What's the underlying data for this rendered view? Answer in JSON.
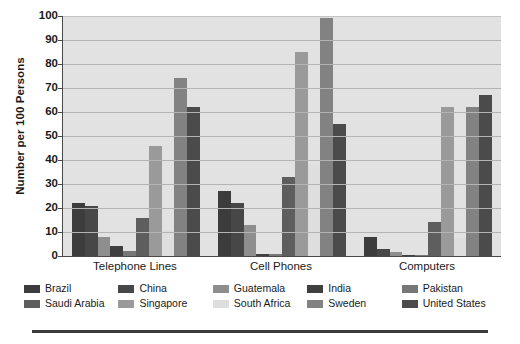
{
  "chart_data": {
    "type": "bar",
    "title": "",
    "subtitle": "",
    "xlabel": "",
    "ylabel": "Number per 100 Persons",
    "ylim": [
      0,
      100
    ],
    "ytick_step": 10,
    "yticks": [
      "0",
      "10",
      "20",
      "30",
      "40",
      "50",
      "60",
      "70",
      "80",
      "90",
      "100"
    ],
    "grid": true,
    "legend_position": "bottom",
    "legend_columns": 5,
    "legend_rows": 2,
    "categories": [
      "Telephone Lines",
      "Cell Phones",
      "Computers"
    ],
    "series": [
      {
        "name": "Brazil",
        "color": "#3c3c3c",
        "values": [
          22,
          27,
          8
        ]
      },
      {
        "name": "China",
        "color": "#474747",
        "values": [
          21,
          22,
          3
        ]
      },
      {
        "name": "Guatemala",
        "color": "#8e8e8e",
        "values": [
          8,
          13,
          1.5
        ]
      },
      {
        "name": "India",
        "color": "#3f3f3f",
        "values": [
          4,
          1,
          0.6
        ]
      },
      {
        "name": "Pakistan",
        "color": "#777777",
        "values": [
          2,
          1,
          0.4
        ]
      },
      {
        "name": "Saudi Arabia",
        "color": "#5e5e5e",
        "values": [
          16,
          33,
          14
        ]
      },
      {
        "name": "Singapore",
        "color": "#9a9a9a",
        "values": [
          46,
          85,
          62
        ]
      },
      {
        "name": "South Africa",
        "color": "#dedede",
        "values": [
          11,
          38,
          7.5
        ]
      },
      {
        "name": "Sweden",
        "color": "#828282",
        "values": [
          74,
          99,
          62
        ]
      },
      {
        "name": "United States",
        "color": "#4b4b4b",
        "values": [
          62,
          55,
          67
        ]
      }
    ],
    "plot_background": "#e2e2e2",
    "gridline_color": "#b4b4b4",
    "axis_color": "#4a4a4a"
  }
}
